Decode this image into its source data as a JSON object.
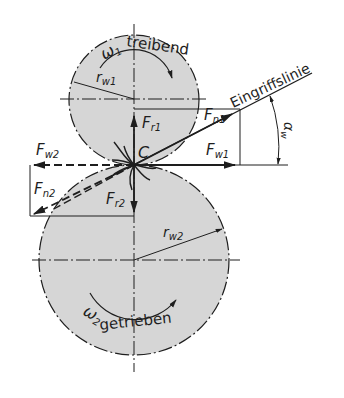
{
  "colors": {
    "background": "#ffffff",
    "gear_fill": "#d6d6d6",
    "line": "#1e1e1e"
  },
  "gear1": {
    "omega_label": "ω",
    "omega_sub": "1",
    "role": "treibend",
    "radius_label": "r",
    "radius_sub": "w1"
  },
  "gear2": {
    "omega_label": "ω",
    "omega_sub": "2",
    "role": "getrieben",
    "radius_label": "r",
    "radius_sub": "w2"
  },
  "pitch_point": "C",
  "line_of_action": "Eingriffslinie",
  "angle": {
    "symbol": "α",
    "sub": "w"
  },
  "forces": {
    "fn1": {
      "main": "F",
      "sub": "n1"
    },
    "fw1": {
      "main": "F",
      "sub": "w1"
    },
    "fr1": {
      "main": "F",
      "sub": "r1"
    },
    "fn2": {
      "main": "F",
      "sub": "n2"
    },
    "fw2": {
      "main": "F",
      "sub": "w2"
    },
    "fr2": {
      "main": "F",
      "sub": "r2"
    }
  }
}
